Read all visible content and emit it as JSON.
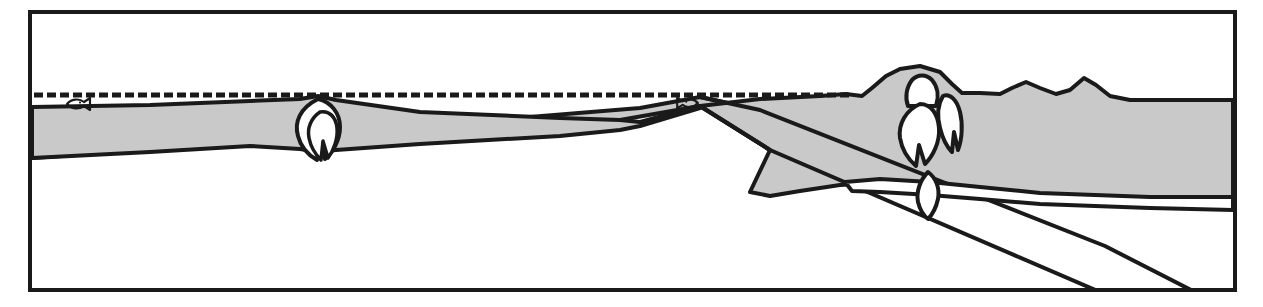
{
  "figure": {
    "type": "geologic-cross-section",
    "title": "",
    "caption": "",
    "width": 1263,
    "height": 307,
    "background_color": "#ffffff"
  },
  "colors": {
    "stroke": "#1a1a1a",
    "crust_fill": "#c9c9c9",
    "mantle_fill": "#ffffff",
    "magma_fill": "#ffffff",
    "frame_stroke": "#1a1a1a",
    "sea_level_stroke": "#1a1a1a"
  },
  "frame": {
    "name": "figure-border",
    "x": 30,
    "y": 12,
    "width": 1205,
    "height": 278,
    "stroke_width": 4
  },
  "sea_level": {
    "label": "",
    "style": "dashed",
    "y": 95,
    "x_start": 34,
    "x_end": 852,
    "dash": "9 4",
    "stroke_width": 5
  },
  "markers": [
    {
      "name": "fish-symbol-left",
      "glyph": "fish",
      "x": 78,
      "y": 104,
      "facing": "right",
      "scale": 1.0
    },
    {
      "name": "fish-symbol-right",
      "glyph": "fish",
      "x": 688,
      "y": 103,
      "facing": "left",
      "scale": 0.9
    }
  ],
  "layers": [
    {
      "name": "overriding-plate-crust",
      "fill": "crust_fill",
      "description": "Shaded upper crustal layer extending across the section"
    },
    {
      "name": "subducting-slab",
      "fill": "crust_fill",
      "description": "Shaded slab descending to the lower right"
    },
    {
      "name": "mantle-wedge",
      "fill": "mantle_fill",
      "description": "Unshaded region below crust and above slab"
    }
  ],
  "intrusions": [
    {
      "name": "magma-body-seamount",
      "fill": "magma_fill",
      "x": 318,
      "y": 130,
      "description": "Teardrop magma body beneath the left seamount"
    },
    {
      "name": "magma-body-volcano-upper",
      "fill": "magma_fill",
      "x": 922,
      "y": 100,
      "description": "Conduit beneath the volcano edifice"
    },
    {
      "name": "magma-body-volcano-main",
      "fill": "magma_fill",
      "x": 920,
      "y": 133,
      "description": "Main teardrop magma chamber beneath the volcano"
    },
    {
      "name": "magma-body-volcano-side",
      "fill": "magma_fill",
      "x": 944,
      "y": 125,
      "description": "Secondary pointed magma body beside the main chamber"
    },
    {
      "name": "magma-body-deep",
      "fill": "magma_fill",
      "x": 928,
      "y": 195,
      "description": "Deep teardrop magma body rising from the slab"
    }
  ],
  "features": [
    {
      "name": "seamount",
      "x": 318,
      "y": 100,
      "label": ""
    },
    {
      "name": "trench-hinge",
      "x": 700,
      "y": 105,
      "label": ""
    },
    {
      "name": "volcano",
      "x": 920,
      "y": 68,
      "label": ""
    },
    {
      "name": "continental-hills",
      "x": 1040,
      "y": 88,
      "label": ""
    }
  ]
}
